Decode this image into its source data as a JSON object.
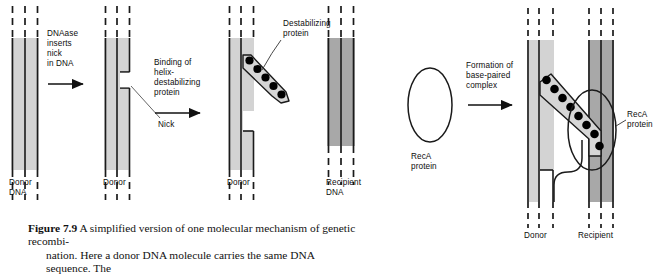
{
  "figure": {
    "number": "7.9",
    "label_prefix": "Figure",
    "caption_line1": "A simplified version of one molecular mechanism of genetic recombi-",
    "caption_line2": "nation. Here a donor DNA molecule carries the same DNA sequence. The"
  },
  "colors": {
    "donor_dna_fill": "#d3d3d3",
    "recipient_dna_fill": "#a8a8a8",
    "strand_line": "#1a1a1a",
    "protein_dot": "#000000",
    "protein_arm_fill": "#d6d6d6",
    "text": "#0d0d0d",
    "background": "#ffffff"
  },
  "steps": [
    {
      "id": "step1",
      "arrow_label_lines": [
        "DNAase",
        "inserts",
        "nick",
        "in DNA"
      ],
      "dna_label_lines": [
        "Donor",
        "DNA"
      ],
      "dna_type": "donor"
    },
    {
      "id": "step2",
      "arrow_label_lines": [
        "Binding of",
        "helix-",
        "destabilizing",
        "protein"
      ],
      "dna_label_lines": [
        "Donor"
      ],
      "dna_type": "donor",
      "annotation": "Nick"
    },
    {
      "id": "step3",
      "arrow_label_lines": [
        "Formation of",
        "base-paired",
        "complex"
      ],
      "dna_label_lines": [
        "Donor"
      ],
      "dna_type": "donor",
      "annotation": "Destabilizing\nprotein",
      "protein_dot_count": 5
    },
    {
      "id": "step4",
      "dna_label_lines": [
        "Recipient",
        "DNA"
      ],
      "dna_type": "recipient"
    }
  ],
  "labels": {
    "donor_dna": "Donor\nDNA",
    "donor": "Donor",
    "recipient_dna": "Recipient\nDNA",
    "recipient": "Recipient",
    "nick": "Nick",
    "destabilizing_protein_l1": "Destabilizing",
    "destabilizing_protein_l2": "protein",
    "reca_protein_l1": "RecA",
    "reca_protein_l2": "protein",
    "reca_protein_final_l1": "RecA",
    "reca_protein_final_l2": "protein",
    "arrow1_l1": "DNAase",
    "arrow1_l2": "inserts",
    "arrow1_l3": "nick",
    "arrow1_l4": "in DNA",
    "arrow2_l1": "Binding of",
    "arrow2_l2": "helix-",
    "arrow2_l3": "destabilizing",
    "arrow2_l4": "protein",
    "arrow3_l1": "Formation of",
    "arrow3_l2": "base-paired",
    "arrow3_l3": "complex",
    "final_donor": "Donor",
    "final_recipient": "Recipient"
  },
  "counts": {
    "destabilizing_protein_dots": 5,
    "complex_protein_dots": 8
  }
}
